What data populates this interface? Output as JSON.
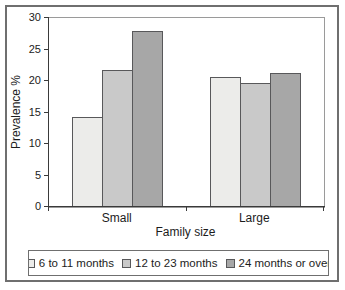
{
  "chart_data": {
    "type": "bar",
    "title": "",
    "xlabel": "Family size",
    "ylabel": "Prevalence %",
    "categories": [
      "Small",
      "Large"
    ],
    "series": [
      {
        "name": "6 to 11 months",
        "values": [
          14.3,
          20.6
        ],
        "color": "#ececea"
      },
      {
        "name": "12 to 23 months",
        "values": [
          21.8,
          19.7
        ],
        "color": "#c9c9c9"
      },
      {
        "name": "24 months or over",
        "values": [
          28.0,
          21.2
        ],
        "color": "#a7a7a7"
      }
    ],
    "ylim": [
      0,
      30
    ],
    "yticks": [
      0,
      5,
      10,
      15,
      20,
      25,
      30
    ],
    "grid": false,
    "legend_position": "bottom",
    "colors": {
      "bar_border": "#58585a",
      "axis_line": "#3a3a3a",
      "plot_border": "#9a9a9a",
      "outer_frame_border": "#6f6f6f",
      "background": "#ffffff"
    }
  }
}
